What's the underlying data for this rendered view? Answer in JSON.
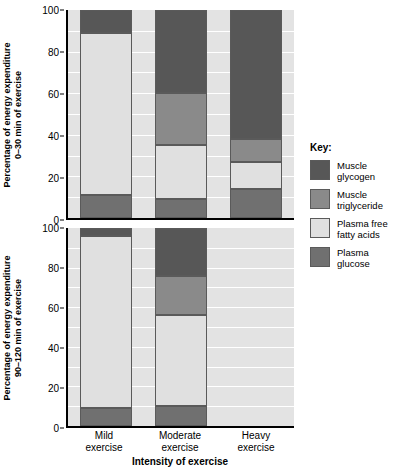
{
  "chart_data": {
    "type": "bar",
    "title": "",
    "xlabel": "Intensity of exercise",
    "categories": [
      "Mild exercise",
      "Moderate exercise",
      "Heavy exercise"
    ],
    "category_lines": [
      [
        "Mild",
        "exercise"
      ],
      [
        "Moderate",
        "exercise"
      ],
      [
        "Heavy",
        "exercise"
      ]
    ],
    "ylim": [
      0,
      100
    ],
    "yticks": [
      0,
      20,
      40,
      60,
      80,
      100
    ],
    "gridlines": [
      10,
      20,
      30,
      40,
      50,
      60,
      70,
      80,
      90
    ],
    "grid": true,
    "stacked": true,
    "legend_position": "right",
    "legend_title": "Key:",
    "series": [
      {
        "name": "Muscle glycogen",
        "name_lines": [
          "Muscle",
          "glycogen"
        ],
        "color": "#575757",
        "panels": {
          "0-30 min of exercise": [
            11,
            40,
            62
          ],
          "90-120 min of exercise": [
            4,
            24,
            0
          ]
        }
      },
      {
        "name": "Muscle triglyceride",
        "name_lines": [
          "Muscle",
          "triglyceride"
        ],
        "color": "#8a8a8a",
        "panels": {
          "0-30 min of exercise": [
            0,
            25,
            11
          ],
          "90-120 min of exercise": [
            0,
            20,
            0
          ]
        }
      },
      {
        "name": "Plasma free fatty acids",
        "name_lines": [
          "Plasma free",
          "fatty acids"
        ],
        "color": "#e0e0e0",
        "panels": {
          "0-30 min of exercise": [
            78,
            26,
            13
          ],
          "90-120 min of exercise": [
            87,
            46,
            0
          ]
        }
      },
      {
        "name": "Plasma glucose",
        "name_lines": [
          "Plasma",
          "glucose"
        ],
        "color": "#707070",
        "panels": {
          "0-30 min of exercise": [
            11,
            9,
            14
          ],
          "90-120 min of exercise": [
            9,
            10,
            0
          ]
        }
      }
    ],
    "panels": [
      {
        "id": "top",
        "ylabel": "Percentage of energy expenditure",
        "ylabel_line2": "0–30 min of exercise",
        "key": "0-30 min of exercise",
        "bars": [
          {
            "category": "Mild exercise",
            "segments": [
              {
                "series": "Plasma glucose",
                "from": 0,
                "to": 11,
                "value": 11
              },
              {
                "series": "Plasma free fatty acids",
                "from": 11,
                "to": 89,
                "value": 78
              },
              {
                "series": "Muscle glycogen",
                "from": 89,
                "to": 100,
                "value": 11
              }
            ]
          },
          {
            "category": "Moderate exercise",
            "segments": [
              {
                "series": "Plasma glucose",
                "from": 0,
                "to": 9,
                "value": 9
              },
              {
                "series": "Plasma free fatty acids",
                "from": 9,
                "to": 35,
                "value": 26
              },
              {
                "series": "Muscle triglyceride",
                "from": 35,
                "to": 60,
                "value": 25
              },
              {
                "series": "Muscle glycogen",
                "from": 60,
                "to": 100,
                "value": 40
              }
            ]
          },
          {
            "category": "Heavy exercise",
            "segments": [
              {
                "series": "Plasma glucose",
                "from": 0,
                "to": 14,
                "value": 14
              },
              {
                "series": "Plasma free fatty acids",
                "from": 14,
                "to": 27,
                "value": 13
              },
              {
                "series": "Muscle triglyceride",
                "from": 27,
                "to": 38,
                "value": 11
              },
              {
                "series": "Muscle glycogen",
                "from": 38,
                "to": 100,
                "value": 62
              }
            ]
          }
        ]
      },
      {
        "id": "bottom",
        "ylabel": "Percentage of energy expenditure",
        "ylabel_line2": "90–120 min of exercise",
        "key": "90-120 min of exercise",
        "bars": [
          {
            "category": "Mild exercise",
            "segments": [
              {
                "series": "Plasma glucose",
                "from": 0,
                "to": 9,
                "value": 9
              },
              {
                "series": "Plasma free fatty acids",
                "from": 9,
                "to": 96,
                "value": 87
              },
              {
                "series": "Muscle glycogen",
                "from": 96,
                "to": 100,
                "value": 4
              }
            ]
          },
          {
            "category": "Moderate exercise",
            "segments": [
              {
                "series": "Plasma glucose",
                "from": 0,
                "to": 10,
                "value": 10
              },
              {
                "series": "Plasma free fatty acids",
                "from": 10,
                "to": 56,
                "value": 46
              },
              {
                "series": "Muscle triglyceride",
                "from": 56,
                "to": 76,
                "value": 20
              },
              {
                "series": "Muscle glycogen",
                "from": 76,
                "to": 100,
                "value": 24
              }
            ]
          },
          {
            "category": "Heavy exercise",
            "segments": []
          }
        ]
      }
    ]
  }
}
